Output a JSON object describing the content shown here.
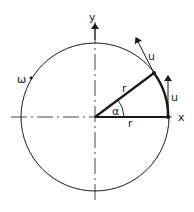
{
  "diagram": {
    "colors": {
      "line": "#1a1a1a",
      "background": "#ffffff"
    },
    "labels": {
      "y_axis": "y",
      "x_axis": "x",
      "omega": "ω",
      "radius_upper": "r",
      "radius_lower": "r",
      "angle": "α",
      "velocity_upper": "u",
      "velocity_right": "u"
    }
  }
}
